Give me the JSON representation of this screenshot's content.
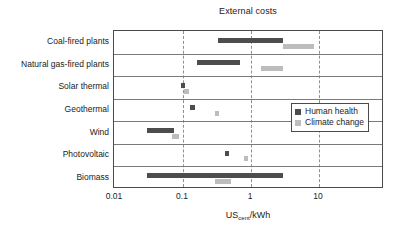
{
  "chart_data": {
    "type": "bar",
    "orientation": "horizontal",
    "title": "External costs",
    "xlabel_prefix": "US",
    "xlabel_sub": "cent",
    "xlabel_suffix": "/kWh",
    "xlabel_full": "UScent/kWh",
    "ylabel": "",
    "xscale": "log",
    "xlim": [
      0.01,
      50
    ],
    "grid": "vertical-dashed-at-decades",
    "legend_position": "middle-right",
    "tick_labels": [
      "0.01",
      "0.1",
      "1",
      "10"
    ],
    "tick_values": [
      0.01,
      0.1,
      1,
      10
    ],
    "categories": [
      "Coal-fired plants",
      "Natural gas-fired plants",
      "Solar thermal",
      "Geothermal",
      "Wind",
      "Photovoltaic",
      "Biomass"
    ],
    "series": [
      {
        "name": "Human health",
        "color": "#4d4d4d",
        "ranges": [
          [
            0.33,
            3.0
          ],
          [
            0.16,
            0.7
          ],
          [
            0.095,
            0.108
          ],
          [
            0.128,
            0.15
          ],
          [
            0.03,
            0.075
          ],
          [
            0.41,
            0.47
          ],
          [
            0.03,
            3.0
          ]
        ]
      },
      {
        "name": "Climate change",
        "color": "#bdbdbd",
        "ranges": [
          [
            3.0,
            8.5
          ],
          [
            1.4,
            3.0
          ],
          [
            0.105,
            0.122
          ],
          [
            0.295,
            0.335
          ],
          [
            0.07,
            0.086
          ],
          [
            0.8,
            0.9
          ],
          [
            0.3,
            0.5
          ]
        ]
      }
    ]
  },
  "legend": {
    "items": [
      {
        "label": "Human health",
        "color": "#4d4d4d"
      },
      {
        "label": "Climate change",
        "color": "#bdbdbd"
      }
    ]
  },
  "colors": {
    "human_health": "#4d4d4d",
    "climate_change": "#bdbdbd",
    "frame": "#4a4a4a",
    "gridline": "#8f8f8f",
    "row_separator": "#7a7a7a",
    "text": "#222222",
    "background": "#ffffff"
  }
}
